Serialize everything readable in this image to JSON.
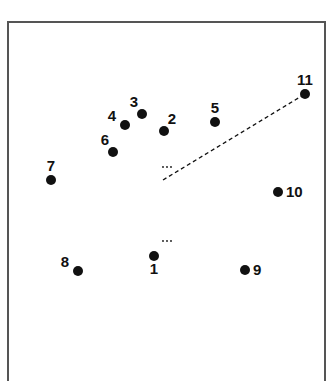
{
  "figure": {
    "type": "point-configuration",
    "ink_color": "#111111",
    "frame_color": "#555555",
    "background": "#ffffff"
  },
  "points": [
    {
      "id": "1",
      "label": "1",
      "label_side": "below"
    },
    {
      "id": "2",
      "label": "2",
      "label_side": "above-right"
    },
    {
      "id": "3",
      "label": "3",
      "label_side": "above-left"
    },
    {
      "id": "4",
      "label": "4",
      "label_side": "left"
    },
    {
      "id": "5",
      "label": "5",
      "label_side": "above"
    },
    {
      "id": "6",
      "label": "6",
      "label_side": "above-left"
    },
    {
      "id": "7",
      "label": "7",
      "label_side": "above"
    },
    {
      "id": "8",
      "label": "8",
      "label_side": "left"
    },
    {
      "id": "9",
      "label": "9",
      "label_side": "right"
    },
    {
      "id": "10",
      "label": "10",
      "label_side": "right"
    },
    {
      "id": "11",
      "label": "11",
      "label_side": "above"
    }
  ],
  "connections": [
    {
      "from": "center",
      "to": "11",
      "style": "dashed"
    }
  ],
  "ellipsis_marks": [
    {
      "text": "…",
      "near": "center-upper"
    },
    {
      "text": "…",
      "near": "point-1"
    }
  ]
}
